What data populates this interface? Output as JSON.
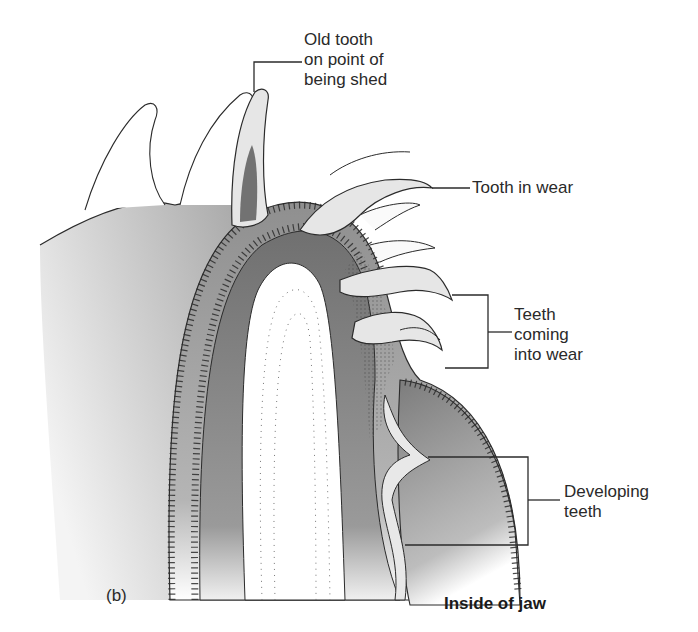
{
  "figure": {
    "panel_label": "(b)",
    "caption": "Inside of jaw",
    "colors": {
      "background": "#ffffff",
      "outline": "#2b2b2b",
      "tissue_dark": "#7a7a7a",
      "tissue_mid": "#9c9c9c",
      "tissue_light": "#c8c8c8",
      "tooth_fill": "#e6e6e6",
      "bone_core": "#ffffff"
    },
    "labels": [
      {
        "id": "old-tooth",
        "text": "Old tooth\non point of\nbeing shed"
      },
      {
        "id": "tooth-in-wear",
        "text": "Tooth in wear"
      },
      {
        "id": "teeth-coming-into-wear",
        "text": "Teeth\ncoming\ninto wear"
      },
      {
        "id": "developing-teeth",
        "text": "Developing\nteeth"
      }
    ]
  }
}
